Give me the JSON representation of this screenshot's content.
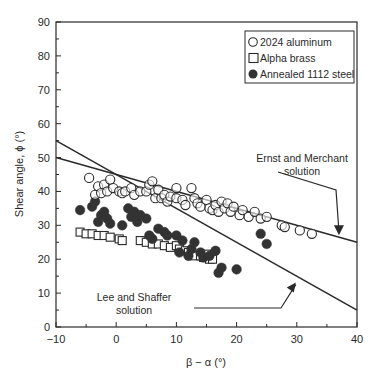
{
  "chart_data": {
    "type": "scatter",
    "title": "",
    "xlabel": "β − α (°)",
    "ylabel": "Shear angle, ϕ (°)",
    "xlim": [
      -10,
      40
    ],
    "ylim": [
      0,
      90
    ],
    "xticks": [
      -10,
      0,
      10,
      20,
      30,
      40
    ],
    "yticks": [
      0,
      10,
      20,
      30,
      40,
      50,
      60,
      70,
      80,
      90
    ],
    "grid": false,
    "legend_position": "upper right",
    "legend": [
      "2024 aluminum",
      "Alpha brass",
      "Annealed 1112 steel"
    ],
    "series": [
      {
        "name": "2024 aluminum",
        "marker": "open-circle",
        "points": [
          [
            -4.5,
            44
          ],
          [
            -3.5,
            39
          ],
          [
            -3,
            41.5
          ],
          [
            -2,
            42
          ],
          [
            -2.5,
            39.5
          ],
          [
            -1.5,
            40
          ],
          [
            -1,
            43.5
          ],
          [
            -0.5,
            41
          ],
          [
            0.5,
            40
          ],
          [
            1,
            39.5
          ],
          [
            1.5,
            40
          ],
          [
            2.5,
            41
          ],
          [
            3,
            39
          ],
          [
            4,
            40
          ],
          [
            5,
            40
          ],
          [
            5.5,
            42
          ],
          [
            6,
            43
          ],
          [
            6.5,
            38
          ],
          [
            7,
            40.5
          ],
          [
            7.5,
            38
          ],
          [
            8,
            39
          ],
          [
            8.5,
            37
          ],
          [
            9,
            38.5
          ],
          [
            10,
            41
          ],
          [
            10,
            38
          ],
          [
            11,
            37.5
          ],
          [
            11.5,
            36
          ],
          [
            12.5,
            41
          ],
          [
            13,
            38
          ],
          [
            13.5,
            36.5
          ],
          [
            14,
            35.5
          ],
          [
            15,
            37.5
          ],
          [
            15.5,
            35
          ],
          [
            16,
            34.5
          ],
          [
            16.5,
            36
          ],
          [
            17,
            34
          ],
          [
            17.5,
            37
          ],
          [
            18,
            35
          ],
          [
            18.5,
            36.5
          ],
          [
            19,
            34
          ],
          [
            19.5,
            35.5
          ],
          [
            20.5,
            33
          ],
          [
            21,
            34.5
          ],
          [
            22,
            32.5
          ],
          [
            23,
            34
          ],
          [
            24,
            32
          ],
          [
            25,
            32.5
          ],
          [
            27.5,
            30
          ],
          [
            28,
            29.5
          ],
          [
            30.5,
            28.5
          ],
          [
            32.5,
            27.5
          ]
        ]
      },
      {
        "name": "Alpha brass",
        "marker": "open-square",
        "points": [
          [
            -6,
            28
          ],
          [
            -5,
            27.5
          ],
          [
            -4,
            27.5
          ],
          [
            -3,
            27
          ],
          [
            -2,
            27
          ],
          [
            -1,
            26.5
          ],
          [
            0.5,
            26
          ],
          [
            1,
            25.5
          ],
          [
            4,
            25.5
          ],
          [
            5,
            25
          ],
          [
            6,
            24.5
          ],
          [
            7,
            24.5
          ],
          [
            8,
            24
          ],
          [
            9,
            23.5
          ],
          [
            10,
            24
          ],
          [
            10.5,
            23
          ],
          [
            11.5,
            22.5
          ],
          [
            12,
            22
          ],
          [
            13,
            21
          ],
          [
            14,
            21
          ],
          [
            14.5,
            20.5
          ],
          [
            15,
            21.5
          ],
          [
            15.5,
            20
          ],
          [
            16,
            20
          ]
        ]
      },
      {
        "name": "Annealed 1112 steel",
        "marker": "filled-circle",
        "points": [
          [
            -6,
            34.5
          ],
          [
            -4,
            35.5
          ],
          [
            -3.5,
            37
          ],
          [
            -2.5,
            33
          ],
          [
            -3,
            31
          ],
          [
            -2,
            34
          ],
          [
            -1.5,
            32
          ],
          [
            -1,
            30.5
          ],
          [
            1,
            30
          ],
          [
            2,
            35
          ],
          [
            2.5,
            32.5
          ],
          [
            3,
            34
          ],
          [
            3.5,
            31
          ],
          [
            4,
            33
          ],
          [
            5,
            32
          ],
          [
            5.5,
            27
          ],
          [
            6,
            26
          ],
          [
            7,
            29
          ],
          [
            8,
            28
          ],
          [
            8.5,
            27
          ],
          [
            10,
            27
          ],
          [
            10.5,
            22
          ],
          [
            11,
            25.5
          ],
          [
            12,
            21
          ],
          [
            12.5,
            23
          ],
          [
            13,
            25
          ],
          [
            14,
            22
          ],
          [
            14.5,
            20.5
          ],
          [
            15.5,
            21
          ],
          [
            16.5,
            22.5
          ],
          [
            17,
            16
          ],
          [
            17.5,
            17.5
          ],
          [
            20,
            17
          ],
          [
            24,
            27.5
          ],
          [
            25,
            24.5
          ]
        ]
      },
      {
        "name": "Ernst and Merchant solution",
        "marker": "line",
        "equation": "ϕ = 45 − (β−α)/2",
        "points": [
          [
            -10,
            50
          ],
          [
            40,
            25
          ]
        ]
      },
      {
        "name": "Lee and Shaffer solution",
        "marker": "line",
        "equation": "ϕ = 45 − (β−α)",
        "points": [
          [
            -10,
            55
          ],
          [
            40,
            5
          ]
        ]
      }
    ],
    "annotations": [
      {
        "text": [
          "Ernst and Merchant",
          "solution"
        ],
        "target": [
          37,
          26.5
        ]
      },
      {
        "text": [
          "Lee and Shaffer",
          "solution"
        ],
        "target": [
          30,
          14
        ]
      }
    ]
  },
  "colors": {
    "ink": "#2a2a2a",
    "fill": "#333333",
    "background": "#ffffff"
  }
}
